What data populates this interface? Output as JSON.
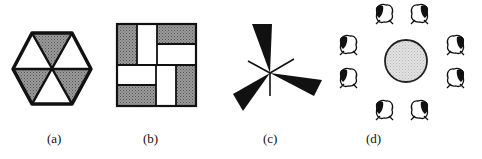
{
  "figure": {
    "panels": [
      {
        "id": "a",
        "label": "(a)",
        "description": "hexagon divided into six triangles, three shaded"
      },
      {
        "id": "b",
        "label": "(b)",
        "description": "square pinwheel tiling of rectangles, four shaded"
      },
      {
        "id": "c",
        "label": "(c)",
        "description": "three-bladed propeller with thin axis lines"
      },
      {
        "id": "d",
        "label": "(d)",
        "description": "shaded circle surrounded by eight animal figures"
      }
    ]
  },
  "colors": {
    "stroke": "#111111",
    "shade": "#8a8a8a",
    "circle_fill": "#d8d8d8",
    "background": "#ffffff"
  }
}
